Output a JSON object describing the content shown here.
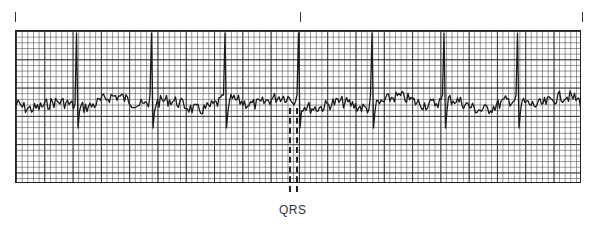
{
  "figure": {
    "type": "ecg-strip",
    "annotation_label": "QRS",
    "time_ticks_x": [
      15,
      300,
      582
    ],
    "grid": {
      "left": 15,
      "top": 30,
      "width": 566,
      "height": 153,
      "small_box_px": 5.66,
      "large_box_px": 28.3
    },
    "baseline_y": 103,
    "qrs_positions_x": [
      78,
      152,
      226,
      299,
      373,
      445,
      519
    ],
    "trace_color": "#1a1a1a",
    "grid_color": "#3c3c3c"
  }
}
